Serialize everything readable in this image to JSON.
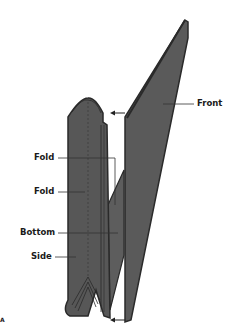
{
  "diagram": {
    "labels": {
      "front": "Front",
      "fold_top": "Fold",
      "fold_mid": "Fold",
      "bottom": "Bottom",
      "side": "Side",
      "corner_mark": "A"
    },
    "colors": {
      "panel_fill": "#5a5a5a",
      "panel_edge": "#2a2a2a",
      "leader": "#333333",
      "background": "#ffffff"
    }
  }
}
